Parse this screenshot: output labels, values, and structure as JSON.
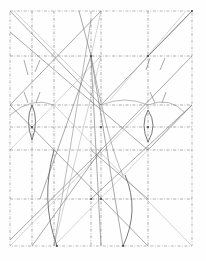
{
  "drawing": {
    "title": "",
    "kind": "geometric construction sketch",
    "width": 206,
    "height": 261,
    "colors": {
      "background": "#fefefe",
      "grid": "#8a8a8a",
      "lines": "#6e6e6e",
      "arcs": "#555555"
    },
    "frame": {
      "left": 10,
      "top": 11,
      "right": 192,
      "bottom": 246
    },
    "vertical_grid_x": [
      32,
      54,
      91,
      101,
      148
    ],
    "horizontal_grid_y": [
      56,
      105,
      127,
      150,
      199
    ],
    "diagonals": [
      [
        10,
        11,
        101,
        105
      ],
      [
        14,
        11,
        103,
        100
      ],
      [
        10,
        32,
        148,
        150
      ],
      [
        10,
        105,
        101,
        11
      ],
      [
        10,
        150,
        101,
        56
      ],
      [
        192,
        11,
        148,
        56
      ],
      [
        192,
        11,
        101,
        105
      ],
      [
        185,
        12,
        110,
        100
      ],
      [
        192,
        56,
        101,
        150
      ],
      [
        192,
        105,
        148,
        150
      ],
      [
        10,
        246,
        148,
        105
      ],
      [
        32,
        246,
        101,
        150
      ],
      [
        10,
        240,
        101,
        150
      ],
      [
        54,
        246,
        192,
        105
      ],
      [
        91,
        199,
        192,
        105
      ],
      [
        10,
        105,
        148,
        246
      ],
      [
        54,
        105,
        192,
        246
      ],
      [
        91,
        150,
        148,
        199
      ],
      [
        79,
        11,
        91,
        56
      ],
      [
        101,
        11,
        91,
        56
      ],
      [
        91,
        56,
        101,
        246
      ],
      [
        91,
        56,
        123,
        246
      ],
      [
        101,
        56,
        54,
        246
      ],
      [
        91,
        56,
        40,
        199
      ]
    ],
    "short_ticks": [
      [
        24,
        60,
        28,
        75
      ],
      [
        40,
        60,
        35,
        72
      ],
      [
        24,
        92,
        28,
        103
      ],
      [
        40,
        92,
        36,
        103
      ],
      [
        166,
        92,
        162,
        103
      ],
      [
        150,
        92,
        155,
        103
      ],
      [
        150,
        58,
        146,
        70
      ],
      [
        165,
        58,
        160,
        70
      ]
    ],
    "arcs": [
      {
        "d": "M10 115 Q 32 96 54 105",
        "style": "arc-light"
      },
      {
        "d": "M32 105 Q 25 120 32 140",
        "style": "arc"
      },
      {
        "d": "M32 105 Q 39 120 32 140",
        "style": "arc"
      },
      {
        "d": "M101 105 Q 125 95 148 105",
        "style": "arc-light"
      },
      {
        "d": "M148 105 Q 170 96 185 113",
        "style": "arc-light"
      },
      {
        "d": "M148 110 Q 140 125 148 142",
        "style": "arc"
      },
      {
        "d": "M148 110 Q 158 125 148 142",
        "style": "arc"
      },
      {
        "d": "M91 20 Q 70 150 54 246",
        "style": "arc-light"
      },
      {
        "d": "M54 150 Q 40 200 57 246",
        "style": "arc"
      },
      {
        "d": "M125 175 Q 140 210 123 246",
        "style": "arc"
      },
      {
        "d": "M91 56 Q 110 150 123 175",
        "style": "arc-light"
      }
    ],
    "points": [
      [
        91,
        56
      ],
      [
        101,
        127
      ],
      [
        148,
        56
      ],
      [
        192,
        11
      ],
      [
        91,
        199
      ],
      [
        101,
        199
      ],
      [
        32,
        127
      ],
      [
        148,
        127
      ],
      [
        123,
        246
      ],
      [
        57,
        246
      ]
    ]
  }
}
